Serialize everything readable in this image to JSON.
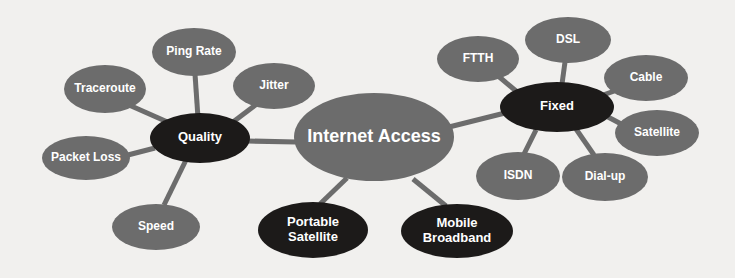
{
  "diagram": {
    "title": "Internet Access",
    "type": "mind-map",
    "background_color": "#f1f0ee",
    "palette": {
      "node_gray": "#6c6c6c",
      "node_dark": "#1c1a19",
      "edge_gray": "#6c6c6c",
      "label_text": "#ffffff"
    },
    "nodes": [
      {
        "id": "internet-access",
        "label": "Internet Access",
        "lines": [
          "Internet Access"
        ],
        "style": "gray",
        "fill": "#6c6c6c",
        "cx": 374,
        "cy": 137,
        "rx": 80,
        "ry": 44,
        "font_size": 18
      },
      {
        "id": "quality",
        "label": "Quality",
        "lines": [
          "Quality"
        ],
        "style": "dark",
        "fill": "#1c1a19",
        "cx": 200,
        "cy": 138,
        "rx": 50,
        "ry": 25,
        "font_size": 13
      },
      {
        "id": "fixed",
        "label": "Fixed",
        "lines": [
          "Fixed"
        ],
        "style": "dark",
        "fill": "#1c1a19",
        "cx": 557,
        "cy": 107,
        "rx": 57,
        "ry": 25,
        "font_size": 13
      },
      {
        "id": "portable-satellite",
        "label": "Portable Satellite",
        "lines": [
          "Portable",
          "Satellite"
        ],
        "style": "dark",
        "fill": "#1c1a19",
        "cx": 313,
        "cy": 230,
        "rx": 55,
        "ry": 28,
        "font_size": 13
      },
      {
        "id": "mobile-broadband",
        "label": "Mobile Broadband",
        "lines": [
          "Mobile",
          "Broadband"
        ],
        "style": "dark",
        "fill": "#1c1a19",
        "cx": 457,
        "cy": 231,
        "rx": 56,
        "ry": 27,
        "font_size": 13
      },
      {
        "id": "ping-rate",
        "label": "Ping Rate",
        "lines": [
          "Ping Rate"
        ],
        "style": "gray",
        "fill": "#6c6c6c",
        "cx": 194,
        "cy": 52,
        "rx": 42,
        "ry": 24,
        "font_size": 12
      },
      {
        "id": "traceroute",
        "label": "Traceroute",
        "lines": [
          "Traceroute"
        ],
        "style": "gray",
        "fill": "#6c6c6c",
        "cx": 105,
        "cy": 89,
        "rx": 41,
        "ry": 24,
        "font_size": 12
      },
      {
        "id": "jitter",
        "label": "Jitter",
        "lines": [
          "Jitter"
        ],
        "style": "gray",
        "fill": "#6c6c6c",
        "cx": 274,
        "cy": 86,
        "rx": 41,
        "ry": 23,
        "font_size": 12
      },
      {
        "id": "packet-loss",
        "label": "Packet Loss",
        "lines": [
          "Packet Loss"
        ],
        "style": "gray",
        "fill": "#6c6c6c",
        "cx": 86,
        "cy": 158,
        "rx": 44,
        "ry": 22,
        "font_size": 12
      },
      {
        "id": "speed",
        "label": "Speed",
        "lines": [
          "Speed"
        ],
        "style": "gray",
        "fill": "#6c6c6c",
        "cx": 156,
        "cy": 227,
        "rx": 44,
        "ry": 23,
        "font_size": 12
      },
      {
        "id": "ftth",
        "label": "FTTH",
        "lines": [
          "FTTH"
        ],
        "style": "gray",
        "fill": "#6c6c6c",
        "cx": 478,
        "cy": 59,
        "rx": 41,
        "ry": 23,
        "font_size": 12
      },
      {
        "id": "dsl",
        "label": "DSL",
        "lines": [
          "DSL"
        ],
        "style": "gray",
        "fill": "#6c6c6c",
        "cx": 568,
        "cy": 40,
        "rx": 43,
        "ry": 23,
        "font_size": 12
      },
      {
        "id": "cable",
        "label": "Cable",
        "lines": [
          "Cable"
        ],
        "style": "gray",
        "fill": "#6c6c6c",
        "cx": 646,
        "cy": 78,
        "rx": 42,
        "ry": 23,
        "font_size": 12
      },
      {
        "id": "satellite",
        "label": "Satellite",
        "lines": [
          "Satellite"
        ],
        "style": "gray",
        "fill": "#6c6c6c",
        "cx": 657,
        "cy": 133,
        "rx": 42,
        "ry": 23,
        "font_size": 12
      },
      {
        "id": "dial-up",
        "label": "Dial-up",
        "lines": [
          "Dial-up"
        ],
        "style": "gray",
        "fill": "#6c6c6c",
        "cx": 605,
        "cy": 177,
        "rx": 43,
        "ry": 24,
        "font_size": 12
      },
      {
        "id": "isdn",
        "label": "ISDN",
        "lines": [
          "ISDN"
        ],
        "style": "gray",
        "fill": "#6c6c6c",
        "cx": 518,
        "cy": 176,
        "rx": 42,
        "ry": 24,
        "font_size": 12
      }
    ],
    "edges": [
      {
        "id": "edge-internet-quality",
        "from": "internet-access",
        "to": "quality",
        "x1": 296,
        "y1": 142,
        "x2": 248,
        "y2": 141,
        "width": 5
      },
      {
        "id": "edge-internet-fixed",
        "from": "internet-access",
        "to": "fixed",
        "x1": 449,
        "y1": 127,
        "x2": 505,
        "y2": 113,
        "width": 5
      },
      {
        "id": "edge-internet-portable",
        "from": "internet-access",
        "to": "portable-satellite",
        "x1": 347,
        "y1": 178,
        "x2": 320,
        "y2": 204,
        "width": 5
      },
      {
        "id": "edge-internet-mobile",
        "from": "internet-access",
        "to": "mobile-broadband",
        "x1": 413,
        "y1": 179,
        "x2": 446,
        "y2": 206,
        "width": 5
      },
      {
        "id": "edge-quality-ping",
        "from": "quality",
        "to": "ping-rate",
        "x1": 198,
        "y1": 118,
        "x2": 195,
        "y2": 74,
        "width": 5
      },
      {
        "id": "edge-quality-traceroute",
        "from": "quality",
        "to": "traceroute",
        "x1": 172,
        "y1": 124,
        "x2": 129,
        "y2": 105,
        "width": 5
      },
      {
        "id": "edge-quality-jitter",
        "from": "quality",
        "to": "jitter",
        "x1": 233,
        "y1": 122,
        "x2": 258,
        "y2": 103,
        "width": 5
      },
      {
        "id": "edge-quality-packetloss",
        "from": "quality",
        "to": "packet-loss",
        "x1": 155,
        "y1": 148,
        "x2": 124,
        "y2": 156,
        "width": 5
      },
      {
        "id": "edge-quality-speed",
        "from": "quality",
        "to": "speed",
        "x1": 186,
        "y1": 160,
        "x2": 164,
        "y2": 205,
        "width": 5
      },
      {
        "id": "edge-fixed-ftth",
        "from": "fixed",
        "to": "ftth",
        "x1": 516,
        "y1": 91,
        "x2": 497,
        "y2": 75,
        "width": 5
      },
      {
        "id": "edge-fixed-dsl",
        "from": "fixed",
        "to": "dsl",
        "x1": 562,
        "y1": 84,
        "x2": 565,
        "y2": 62,
        "width": 5
      },
      {
        "id": "edge-fixed-cable",
        "from": "fixed",
        "to": "cable",
        "x1": 603,
        "y1": 95,
        "x2": 623,
        "y2": 88,
        "width": 5
      },
      {
        "id": "edge-fixed-satellite",
        "from": "fixed",
        "to": "satellite",
        "x1": 608,
        "y1": 117,
        "x2": 625,
        "y2": 126,
        "width": 5
      },
      {
        "id": "edge-fixed-dialup",
        "from": "fixed",
        "to": "dial-up",
        "x1": 576,
        "y1": 129,
        "x2": 594,
        "y2": 155,
        "width": 5
      },
      {
        "id": "edge-fixed-isdn",
        "from": "fixed",
        "to": "isdn",
        "x1": 536,
        "y1": 130,
        "x2": 524,
        "y2": 154,
        "width": 5
      }
    ]
  }
}
